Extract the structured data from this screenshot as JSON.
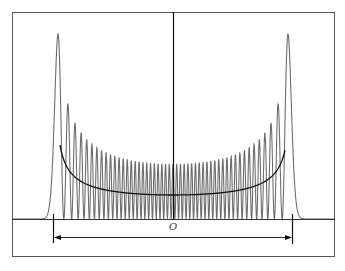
{
  "figure": {
    "origin_label": "O",
    "quantum_number": 50,
    "colors": {
      "frame": "#555555",
      "quantum_curve": "#6e6e6e",
      "classical_curve": "#111111",
      "axis": "#333333"
    }
  },
  "chart_data": {
    "type": "line",
    "title": "",
    "xlabel": "",
    "ylabel": "",
    "annotations": [
      "O",
      "classical amplitude span (double arrow between turning points)"
    ],
    "series": [
      {
        "name": "quantum probability density |psi_n(x)|^2",
        "n": 50,
        "style": "gray oscillating"
      },
      {
        "name": "classical probability density 1/sqrt(A^2-x^2)",
        "style": "black U-shaped, diverges at turning points"
      }
    ],
    "grid": false,
    "legend": "none"
  }
}
